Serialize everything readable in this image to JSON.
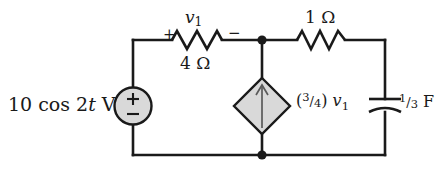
{
  "figure": {
    "wire_color": "#1a1a1a",
    "fill_color": "#d9d9d9",
    "background": "#ffffff"
  },
  "components": {
    "voltage_source": {
      "name": "independent-voltage-source",
      "label": "10 cos 2t V",
      "amplitude": "10",
      "function": "cos",
      "frequency": "2",
      "variable": "t",
      "unit": "V",
      "plus_symbol": "+",
      "minus_symbol": "−",
      "shape": "circle",
      "fill": "#d9d9d9"
    },
    "resistor_4ohm": {
      "name": "resistor-4-ohm",
      "label": "4 Ω",
      "value": "4",
      "unit": "Ω",
      "voltage_label": "v",
      "voltage_subscript": "1",
      "polarity_plus": "+",
      "polarity_minus": "−"
    },
    "resistor_1ohm": {
      "name": "resistor-1-ohm",
      "label": "1 Ω",
      "value": "1",
      "unit": "Ω"
    },
    "dependent_source": {
      "name": "dependent-current-source",
      "label_numerator": "3",
      "label_denominator": "4",
      "label_variable": "v",
      "label_subscript": "1",
      "label_full": "(3/4) v1",
      "shape": "diamond",
      "fill": "#d9d9d9",
      "arrow_direction": "up"
    },
    "capacitor": {
      "name": "capacitor-one-third-farad",
      "label_numerator": "1",
      "label_denominator": "3",
      "label_unit": "F",
      "label_full": "1/3 F"
    },
    "nodes": [
      {
        "name": "node-top-center"
      },
      {
        "name": "node-bottom-center"
      }
    ]
  }
}
